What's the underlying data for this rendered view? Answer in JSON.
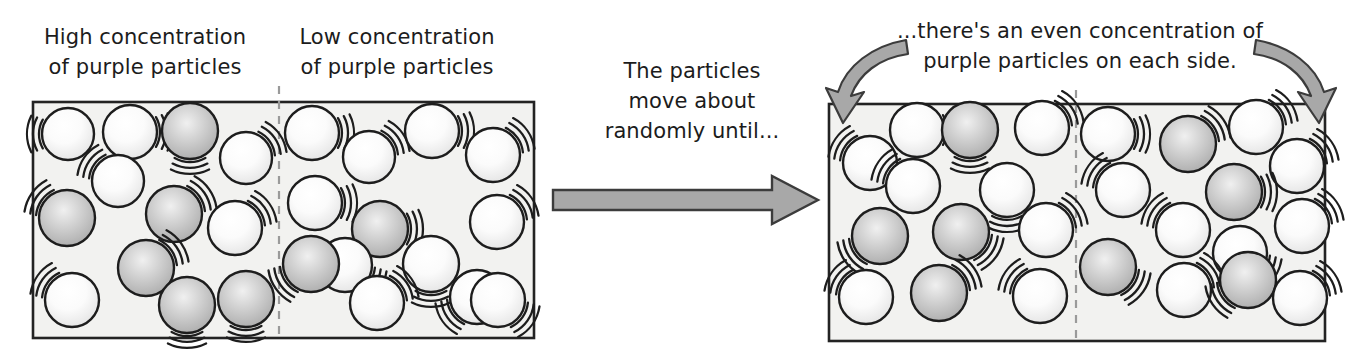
{
  "diagram": {
    "captions": {
      "left_high": "High concentration\nof purple particles",
      "left_low": "Low concentration\nof purple particles",
      "middle": "The particles\nmove about\nrandomly until...",
      "right_final": "...there's an even concentration of\npurple particles on each side."
    },
    "colors": {
      "box_fill": "#f2f2f0",
      "box_stroke": "#232323",
      "divider": "#9a9a9a",
      "arrow_fill": "#a8a8a8",
      "arrow_stroke": "#3c3c3c",
      "particle_plain_fill": "#fdfdfd",
      "particle_purple_fill": "#b9b9b9",
      "particle_stroke": "#1d1d1d",
      "motion_line": "#1d1d1d",
      "text": "#1c1c1c"
    },
    "boxes": [
      {
        "id": "before",
        "x": 33,
        "y": 102,
        "w": 501,
        "h": 236,
        "divider_x": 279,
        "label_left": "High concentration of purple particles",
        "label_right": "Low concentration of purple particles",
        "counts": {
          "left_purple": 6,
          "left_plain": 6,
          "right_purple": 2,
          "right_plain": 11
        }
      },
      {
        "id": "after",
        "x": 829,
        "y": 104,
        "w": 496,
        "h": 237,
        "divider_x": 1076,
        "label_left": "even concentration",
        "label_right": "even concentration",
        "counts": {
          "left_purple": 4,
          "left_plain": 8,
          "right_purple": 4,
          "right_plain": 9
        }
      }
    ],
    "big_arrow": {
      "x1": 553,
      "y1": 200,
      "x2": 818,
      "y2": 200,
      "label": "diffusion-direction"
    },
    "curved_arrows": [
      {
        "id": "left-curved-arrow",
        "from": [
          901,
          43
        ],
        "to": [
          845,
          110
        ]
      },
      {
        "id": "right-curved-arrow",
        "from": [
          1261,
          43
        ],
        "to": [
          1317,
          110
        ]
      }
    ],
    "particles": {
      "before": [
        {
          "cx": 68,
          "cy": 134,
          "r": 26,
          "type": "plain",
          "wig": "left"
        },
        {
          "cx": 130,
          "cy": 132,
          "r": 27,
          "type": "plain",
          "wig": "right"
        },
        {
          "cx": 190,
          "cy": 131,
          "r": 28,
          "type": "purple",
          "wig": "bottom"
        },
        {
          "cx": 246,
          "cy": 158,
          "r": 26,
          "type": "plain",
          "wig": "topright"
        },
        {
          "cx": 118,
          "cy": 181,
          "r": 26,
          "type": "plain",
          "wig": "topleft"
        },
        {
          "cx": 67,
          "cy": 218,
          "r": 28,
          "type": "purple",
          "wig": "topleft"
        },
        {
          "cx": 174,
          "cy": 214,
          "r": 28,
          "type": "purple",
          "wig": "topright"
        },
        {
          "cx": 235,
          "cy": 228,
          "r": 27,
          "type": "plain",
          "wig": "topright"
        },
        {
          "cx": 146,
          "cy": 268,
          "r": 28,
          "type": "purple",
          "wig": "topright"
        },
        {
          "cx": 72,
          "cy": 300,
          "r": 27,
          "type": "plain",
          "wig": "topleft"
        },
        {
          "cx": 187,
          "cy": 305,
          "r": 28,
          "type": "purple",
          "wig": "bottom"
        },
        {
          "cx": 246,
          "cy": 299,
          "r": 28,
          "type": "purple",
          "wig": "bottom"
        },
        {
          "cx": 312,
          "cy": 133,
          "r": 27,
          "type": "plain",
          "wig": "right"
        },
        {
          "cx": 369,
          "cy": 157,
          "r": 26,
          "type": "plain",
          "wig": "topright"
        },
        {
          "cx": 432,
          "cy": 131,
          "r": 27,
          "type": "plain",
          "wig": "right"
        },
        {
          "cx": 493,
          "cy": 155,
          "r": 27,
          "type": "plain",
          "wig": "topright"
        },
        {
          "cx": 315,
          "cy": 203,
          "r": 27,
          "type": "plain",
          "wig": "right"
        },
        {
          "cx": 380,
          "cy": 229,
          "r": 28,
          "type": "purple",
          "wig": "right"
        },
        {
          "cx": 497,
          "cy": 222,
          "r": 27,
          "type": "plain",
          "wig": "topright"
        },
        {
          "cx": 345,
          "cy": 265,
          "r": 27,
          "type": "plain",
          "wig": "bottomright"
        },
        {
          "cx": 311,
          "cy": 264,
          "r": 28,
          "type": "purple",
          "wig": "bottomleft"
        },
        {
          "cx": 431,
          "cy": 264,
          "r": 28,
          "type": "plain",
          "wig": "bottom"
        },
        {
          "cx": 477,
          "cy": 297,
          "r": 27,
          "type": "plain",
          "wig": "bottomleft"
        },
        {
          "cx": 377,
          "cy": 303,
          "r": 27,
          "type": "plain",
          "wig": "topright"
        },
        {
          "cx": 498,
          "cy": 300,
          "r": 27,
          "type": "plain",
          "wig": "bottomright"
        }
      ],
      "after": [
        {
          "cx": 870,
          "cy": 163,
          "r": 27,
          "type": "plain",
          "wig": "topleft"
        },
        {
          "cx": 917,
          "cy": 130,
          "r": 27,
          "type": "plain",
          "wig": "right"
        },
        {
          "cx": 970,
          "cy": 130,
          "r": 28,
          "type": "purple",
          "wig": "bottom"
        },
        {
          "cx": 1042,
          "cy": 128,
          "r": 27,
          "type": "plain",
          "wig": "topright"
        },
        {
          "cx": 913,
          "cy": 186,
          "r": 27,
          "type": "plain",
          "wig": "topleft"
        },
        {
          "cx": 1007,
          "cy": 190,
          "r": 27,
          "type": "plain",
          "wig": "bottom"
        },
        {
          "cx": 880,
          "cy": 236,
          "r": 28,
          "type": "purple",
          "wig": "bottomleft"
        },
        {
          "cx": 961,
          "cy": 232,
          "r": 28,
          "type": "purple",
          "wig": "bottomright"
        },
        {
          "cx": 1046,
          "cy": 230,
          "r": 27,
          "type": "plain",
          "wig": "topright"
        },
        {
          "cx": 866,
          "cy": 297,
          "r": 27,
          "type": "plain",
          "wig": "topleft"
        },
        {
          "cx": 939,
          "cy": 293,
          "r": 28,
          "type": "purple",
          "wig": "topright"
        },
        {
          "cx": 1040,
          "cy": 296,
          "r": 27,
          "type": "plain",
          "wig": "topleft"
        },
        {
          "cx": 1108,
          "cy": 134,
          "r": 27,
          "type": "plain",
          "wig": "right"
        },
        {
          "cx": 1188,
          "cy": 144,
          "r": 28,
          "type": "purple",
          "wig": "topright"
        },
        {
          "cx": 1256,
          "cy": 127,
          "r": 27,
          "type": "plain",
          "wig": "topright"
        },
        {
          "cx": 1297,
          "cy": 166,
          "r": 27,
          "type": "plain",
          "wig": "topright"
        },
        {
          "cx": 1123,
          "cy": 190,
          "r": 27,
          "type": "plain",
          "wig": "topleft"
        },
        {
          "cx": 1234,
          "cy": 192,
          "r": 28,
          "type": "purple",
          "wig": "right"
        },
        {
          "cx": 1302,
          "cy": 226,
          "r": 27,
          "type": "plain",
          "wig": "topright"
        },
        {
          "cx": 1183,
          "cy": 230,
          "r": 27,
          "type": "plain",
          "wig": "topleft"
        },
        {
          "cx": 1108,
          "cy": 267,
          "r": 28,
          "type": "purple",
          "wig": "bottomright"
        },
        {
          "cx": 1240,
          "cy": 253,
          "r": 27,
          "type": "plain",
          "wig": "bottomright"
        },
        {
          "cx": 1184,
          "cy": 290,
          "r": 27,
          "type": "plain",
          "wig": "topright"
        },
        {
          "cx": 1248,
          "cy": 280,
          "r": 28,
          "type": "purple",
          "wig": "bottomleft"
        },
        {
          "cx": 1300,
          "cy": 298,
          "r": 27,
          "type": "plain",
          "wig": "topright"
        }
      ]
    }
  }
}
